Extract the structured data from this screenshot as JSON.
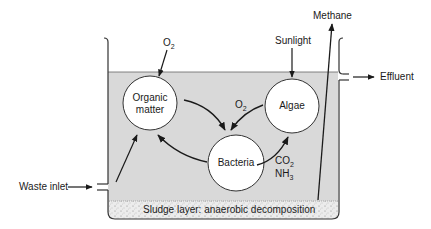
{
  "diagram": {
    "nodes": {
      "organic_matter": {
        "line1": "Organic",
        "line2": "matter"
      },
      "algae": {
        "label": "Algae"
      },
      "bacteria": {
        "label": "Bacteria"
      }
    },
    "inputs": {
      "oxygen_top": {
        "base": "O",
        "sub": "2"
      },
      "sunlight": "Sunlight",
      "waste_inlet": "Waste inlet"
    },
    "outputs": {
      "methane": "Methane",
      "effluent": "Effluent"
    },
    "internal_labels": {
      "oxygen_algae_to_bacteria": {
        "base": "O",
        "sub": "2"
      },
      "co2": {
        "base": "CO",
        "sub": "2"
      },
      "nh3": {
        "base": "NH",
        "sub": "3"
      }
    },
    "sludge_layer": "Sludge layer: anaerobic decomposition",
    "colors": {
      "water": "#d9d9d9",
      "stroke": "#1a1a1a",
      "circle_fill": "#ffffff",
      "sludge_fill": "#e6e6e6"
    }
  }
}
